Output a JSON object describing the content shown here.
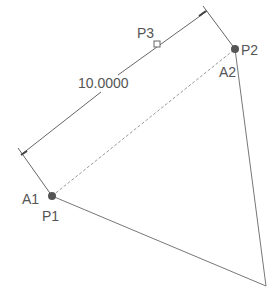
{
  "diagram": {
    "dimension": {
      "value": "10.0000"
    },
    "points": {
      "p1": {
        "label": "P1"
      },
      "p2": {
        "label": "P2"
      },
      "p3": {
        "label": "P3"
      }
    },
    "anchors": {
      "a1": {
        "label": "A1"
      },
      "a2": {
        "label": "A2"
      }
    },
    "colors": {
      "line": "#666666",
      "dashed_line": "#888888",
      "point": "#555555",
      "text": "#555555"
    }
  }
}
